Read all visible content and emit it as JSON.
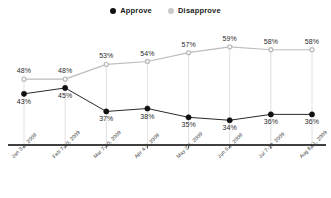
{
  "legend": {
    "position": "top-center",
    "entries": [
      {
        "label": "Approve",
        "color": "#111111",
        "icon": "filled-circle-marker"
      },
      {
        "label": "Disapprove",
        "color": "#bdbdbd",
        "icon": "open-circle-marker"
      }
    ]
  },
  "chart_data": {
    "type": "line",
    "title": "",
    "xlabel": "",
    "ylabel": "",
    "ylim": [
      30,
      62
    ],
    "grid": "vertical-only",
    "categories": [
      "Jan 3-6, 2009",
      "Feb 7-10, 2009",
      "Mar 7-10, 2009",
      "Apr 4-7, 2009",
      "May 2-6, 2009",
      "Jun 6-9, 2009",
      "Jul 7-10, 2009",
      "Aug 8-11, 2009"
    ],
    "series": [
      {
        "name": "Approve",
        "color": "#111111",
        "values": [
          43,
          45,
          37,
          38,
          35,
          34,
          36,
          36
        ],
        "labels": [
          "43%",
          "45%",
          "37%",
          "38%",
          "35%",
          "34%",
          "36%",
          "36%"
        ]
      },
      {
        "name": "Disapprove",
        "color": "#bdbdbd",
        "values": [
          48,
          48,
          53,
          54,
          57,
          59,
          58,
          58
        ],
        "labels": [
          "48%",
          "48%",
          "53%",
          "54%",
          "57%",
          "59%",
          "58%",
          "58%"
        ]
      }
    ]
  },
  "axis": {
    "line_color": "#3f3f3f",
    "tick_color": "#3f3f3f",
    "gridline_color": "#d8d8d8"
  }
}
